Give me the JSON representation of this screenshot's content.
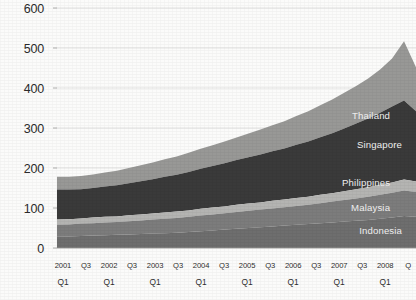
{
  "chart_data": {
    "type": "area",
    "stacked": true,
    "title": "",
    "subtitle": "",
    "xlabel": "",
    "ylabel": "",
    "ylim": [
      0,
      600
    ],
    "yticks": [
      0,
      100,
      200,
      300,
      400,
      500,
      600
    ],
    "grid": true,
    "legend_position": "inline-right",
    "x": [
      "2001 Q1",
      "Q2",
      "Q3",
      "Q4",
      "2002 Q1",
      "Q2",
      "Q3",
      "Q4",
      "2003 Q1",
      "Q2",
      "Q3",
      "Q4",
      "2004 Q1",
      "Q2",
      "Q3",
      "Q4",
      "2005 Q1",
      "Q2",
      "Q3",
      "Q4",
      "2006 Q1",
      "Q2",
      "Q3",
      "Q4",
      "2007 Q1",
      "Q2",
      "Q3",
      "Q4",
      "2008 Q1",
      "Q2",
      "Q3"
    ],
    "xtick_labels_primary": [
      "2001",
      "Q3",
      "2002",
      "Q3",
      "2003",
      "Q3",
      "2004",
      "Q3",
      "2005",
      "Q3",
      "2006",
      "Q3",
      "2007",
      "Q3",
      "2008",
      "Q"
    ],
    "xtick_labels_secondary": [
      "Q1",
      "",
      "Q1",
      "",
      "Q1",
      "",
      "Q1",
      "",
      "Q1",
      "",
      "Q1",
      "",
      "Q1",
      "",
      "Q1",
      ""
    ],
    "series": [
      {
        "name": "Indonesia",
        "color": "#6e6e6e",
        "label_color": "#efefef",
        "values": [
          28,
          29,
          30,
          31,
          32,
          33,
          34,
          35,
          36,
          37,
          38,
          40,
          42,
          44,
          46,
          48,
          50,
          52,
          54,
          56,
          58,
          60,
          62,
          64,
          66,
          68,
          70,
          73,
          76,
          80,
          78
        ]
      },
      {
        "name": "Malaysia",
        "color": "#7c7c7c",
        "label_color": "#f0f0f0",
        "values": [
          30,
          30,
          31,
          31,
          32,
          32,
          33,
          34,
          35,
          36,
          37,
          38,
          39,
          40,
          41,
          42,
          43,
          44,
          45,
          46,
          47,
          48,
          50,
          52,
          54,
          56,
          58,
          60,
          62,
          64,
          62
        ]
      },
      {
        "name": "Philippines",
        "color": "#b4b4b2",
        "label_color": "#ffffff",
        "values": [
          13,
          13,
          13,
          14,
          14,
          14,
          15,
          15,
          15,
          16,
          16,
          16,
          17,
          17,
          17,
          18,
          18,
          18,
          19,
          19,
          20,
          20,
          21,
          21,
          22,
          23,
          24,
          25,
          26,
          27,
          26
        ]
      },
      {
        "name": "Singapore",
        "color": "#3a3a3a",
        "label_color": "#ededed",
        "values": [
          75,
          74,
          73,
          74,
          76,
          78,
          80,
          83,
          86,
          89,
          92,
          96,
          100,
          104,
          108,
          112,
          116,
          120,
          124,
          128,
          133,
          138,
          144,
          150,
          157,
          164,
          172,
          180,
          190,
          198,
          176
        ]
      },
      {
        "name": "Thailand",
        "color": "#989896",
        "label_color": "#f5f5f5",
        "values": [
          32,
          32,
          33,
          34,
          35,
          36,
          38,
          40,
          42,
          44,
          46,
          48,
          50,
          52,
          54,
          56,
          59,
          62,
          65,
          68,
          72,
          76,
          80,
          84,
          89,
          94,
          100,
          108,
          120,
          148,
          110
        ]
      }
    ],
    "inline_labels": [
      {
        "name": "Thailand",
        "x_index": 26,
        "value_anchor": 330
      },
      {
        "name": "Singapore",
        "x_index": 27,
        "value_anchor": 258
      },
      {
        "name": "Philippines",
        "x_index": 26,
        "value_anchor": 163
      },
      {
        "name": "Malaysia",
        "x_index": 26,
        "value_anchor": 100
      },
      {
        "name": "Indonesia",
        "x_index": 27,
        "value_anchor": 42
      }
    ]
  }
}
